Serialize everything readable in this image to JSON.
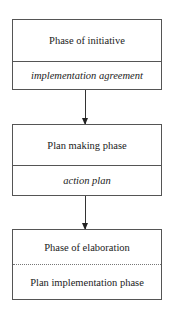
{
  "diagram": {
    "type": "flowchart",
    "direction": "top-to-bottom",
    "boxes": [
      {
        "title": "Phase of initiative",
        "subtitle": "implementation agreement",
        "subtitle_style": "italic",
        "divider": "solid"
      },
      {
        "title": "Plan making phase",
        "subtitle": "action plan",
        "subtitle_style": "italic",
        "divider": "solid"
      },
      {
        "title": "Phase of elaboration",
        "subtitle": "Plan implementation phase",
        "subtitle_style": "normal",
        "divider": "dotted"
      }
    ],
    "arrows": [
      {
        "from": "Phase of initiative",
        "to": "Plan making phase"
      },
      {
        "from": "Plan making phase",
        "to": "Phase of elaboration"
      }
    ],
    "colors": {
      "border": "#555555",
      "text": "#222222",
      "background": "#ffffff"
    }
  }
}
